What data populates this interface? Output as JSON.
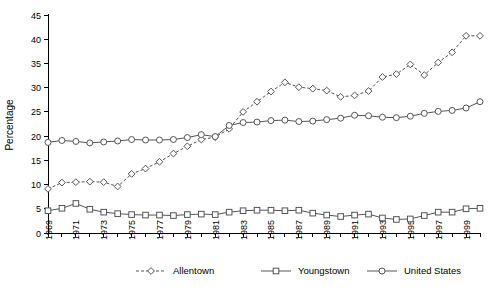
{
  "chart_data": {
    "type": "line",
    "title": "",
    "xlabel": "",
    "ylabel": "Percentage",
    "ylim": [
      0,
      45
    ],
    "ytick_values": [
      0,
      5,
      10,
      15,
      20,
      25,
      30,
      35,
      40,
      45
    ],
    "ytick_labels": [
      "0",
      "5",
      "10",
      "15",
      "20",
      "25",
      "30",
      "35",
      "40",
      "45"
    ],
    "x": [
      1969,
      1970,
      1971,
      1972,
      1973,
      1974,
      1975,
      1976,
      1977,
      1978,
      1979,
      1980,
      1981,
      1982,
      1983,
      1984,
      1985,
      1986,
      1987,
      1988,
      1989,
      1990,
      1991,
      1992,
      1993,
      1994,
      1995,
      1996,
      1997,
      1998,
      1999,
      2000
    ],
    "xtick_labels": [
      "1969",
      "",
      "1971",
      "",
      "1973",
      "",
      "1975",
      "",
      "1977",
      "",
      "1979",
      "",
      "1981",
      "",
      "1983",
      "",
      "1985",
      "",
      "1987",
      "",
      "1989",
      "",
      "1991",
      "",
      "1993",
      "",
      "1995",
      "",
      "1997",
      "",
      "1999",
      ""
    ],
    "xtick_labels_shown": [
      "1969",
      "1971",
      "1973",
      "1975",
      "1977",
      "1979",
      "1981",
      "1983",
      "1985",
      "1987",
      "1989",
      "1991",
      "1993",
      "1995",
      "1997",
      "1999"
    ],
    "grid": false,
    "legend_position": "bottom",
    "series": [
      {
        "name": "Allentown",
        "marker": "diamond",
        "linestyle": "dashed",
        "color": "#555555",
        "values": [
          9.1,
          10.4,
          10.5,
          10.6,
          10.5,
          9.6,
          12.2,
          13.3,
          14.7,
          16.4,
          17.9,
          19.3,
          19.8,
          21.5,
          25.0,
          27.1,
          29.2,
          31.1,
          30.1,
          29.8,
          29.4,
          28.1,
          28.4,
          29.3,
          32.2,
          32.8,
          34.8,
          32.6,
          35.2,
          37.3,
          40.7,
          40.7
        ]
      },
      {
        "name": "Youngstown",
        "marker": "square",
        "linestyle": "solid",
        "color": "#555555",
        "values": [
          4.6,
          5.1,
          6.1,
          4.9,
          4.3,
          4.0,
          3.8,
          3.7,
          3.7,
          3.6,
          3.8,
          3.9,
          3.8,
          4.3,
          4.6,
          4.7,
          4.7,
          4.6,
          4.7,
          4.1,
          3.7,
          3.4,
          3.7,
          3.9,
          3.1,
          2.8,
          2.9,
          3.6,
          4.3,
          4.3,
          5.0,
          5.1
        ]
      },
      {
        "name": "United States",
        "marker": "circle",
        "linestyle": "solid",
        "color": "#555555",
        "values": [
          18.7,
          19.1,
          18.9,
          18.6,
          18.8,
          19.0,
          19.3,
          19.2,
          19.2,
          19.3,
          19.7,
          20.3,
          19.9,
          22.2,
          22.8,
          22.9,
          23.2,
          23.3,
          23.0,
          23.1,
          23.4,
          23.7,
          24.3,
          24.2,
          23.9,
          23.8,
          24.1,
          24.7,
          25.1,
          25.3,
          25.8,
          27.1
        ]
      }
    ]
  },
  "legend": {
    "items": [
      {
        "label": "Allentown"
      },
      {
        "label": "Youngstown"
      },
      {
        "label": "United States"
      }
    ]
  }
}
